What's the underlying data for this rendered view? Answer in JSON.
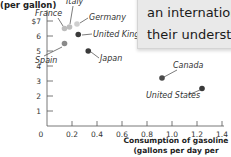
{
  "chart_data": {
    "type": "scatter",
    "title": "",
    "ylabel": "(per gallon)",
    "xlabel": "Consumption of gasoline (gallons per day per capita)",
    "xlabel_lines": [
      "Consumption of gasoline",
      "(gallons per day per capita)"
    ],
    "xlim": [
      0,
      1.4
    ],
    "ylim": [
      0,
      7
    ],
    "x_ticks": [
      "0",
      "0.2",
      "0.4",
      "0.6",
      "0.8",
      "1.0",
      "1.2",
      "1.4"
    ],
    "y_ticks": [
      "1",
      "2",
      "3",
      "4",
      "5",
      "6",
      "$7"
    ],
    "grid": false,
    "points": [
      {
        "label": "France",
        "x": 0.14,
        "y": 6.5,
        "color": "#bdbdbd"
      },
      {
        "label": "Italy",
        "x": 0.18,
        "y": 6.6,
        "color": "#bdbdbd"
      },
      {
        "label": "Germany",
        "x": 0.24,
        "y": 6.8,
        "color": "#cfcfcf"
      },
      {
        "label": "United Kingdom",
        "x": 0.25,
        "y": 6.1,
        "color": "#3a3a3a"
      },
      {
        "label": "Spain",
        "x": 0.14,
        "y": 5.5,
        "color": "#8a8a8a"
      },
      {
        "label": "Japan",
        "x": 0.33,
        "y": 5.0,
        "color": "#3a3a3a"
      },
      {
        "label": "Canada",
        "x": 0.92,
        "y": 3.2,
        "color": "#4a4a4a"
      },
      {
        "label": "United States",
        "x": 1.24,
        "y": 2.5,
        "color": "#3a3a3a"
      }
    ]
  },
  "overlay": {
    "line1": "an international",
    "line2": "their understand"
  }
}
